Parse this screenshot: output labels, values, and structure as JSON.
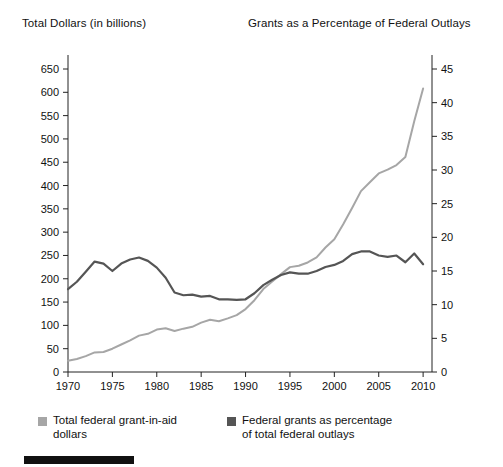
{
  "figure": {
    "left_axis_title": "Total Dollars (in billions)",
    "right_axis_title": "Grants as a Percentage of Federal Outlays"
  },
  "legend": {
    "entries": [
      {
        "label": "Total federal grant-in-aid dollars",
        "color": "#a6a6a6",
        "series": "total_dollars"
      },
      {
        "label": "Federal grants as percentage of total federal outlays",
        "color": "#555555",
        "series": "percent_outlays"
      }
    ]
  },
  "chart_data": {
    "type": "line",
    "title": "",
    "xlabel": "",
    "ylabel": "Total Dollars (in billions)",
    "y2label": "Grants as a Percentage of Federal Outlays",
    "xlim": [
      1970,
      2011
    ],
    "ylim": [
      0,
      650
    ],
    "y2lim": [
      0,
      45
    ],
    "grid": false,
    "legend_position": "bottom-left",
    "xticks": [
      1970,
      1975,
      1980,
      1985,
      1990,
      1995,
      2000,
      2005,
      2010
    ],
    "xtick_labels": [
      "1970",
      "1975",
      "1980",
      "1985",
      "1990",
      "1995",
      "2000",
      "2005",
      "2010"
    ],
    "yticks": [
      0,
      50,
      100,
      150,
      200,
      250,
      300,
      350,
      400,
      450,
      500,
      550,
      600,
      650
    ],
    "ytick_labels": [
      "0",
      "50",
      "100",
      "150",
      "200",
      "250",
      "300",
      "350",
      "400",
      "450",
      "500",
      "550",
      "600",
      "650"
    ],
    "y2ticks": [
      0,
      5,
      10,
      15,
      20,
      25,
      30,
      35,
      40,
      45
    ],
    "y2tick_labels": [
      "0",
      "5",
      "10",
      "15",
      "20",
      "25",
      "30",
      "35",
      "40",
      "45"
    ],
    "x": [
      1970,
      1971,
      1972,
      1973,
      1974,
      1975,
      1976,
      1977,
      1978,
      1979,
      1980,
      1981,
      1982,
      1983,
      1984,
      1985,
      1986,
      1987,
      1988,
      1989,
      1990,
      1991,
      1992,
      1993,
      1994,
      1995,
      1996,
      1997,
      1998,
      1999,
      2000,
      2001,
      2002,
      2003,
      2004,
      2005,
      2006,
      2007,
      2008,
      2009,
      2010
    ],
    "series": [
      {
        "name": "Total federal grant-in-aid dollars",
        "axis": "left",
        "color": "#a6a6a6",
        "units": "billions of dollars",
        "values": [
          24,
          28,
          34,
          42,
          43,
          50,
          59,
          68,
          78,
          82,
          91,
          94,
          88,
          93,
          97,
          106,
          112,
          109,
          115,
          122,
          135,
          154,
          178,
          194,
          210,
          225,
          228,
          235,
          246,
          267,
          285,
          317,
          352,
          388,
          407,
          426,
          434,
          444,
          461,
          538,
          608
        ]
      },
      {
        "name": "Federal grants as percentage of total federal outlays",
        "axis": "right",
        "color": "#555555",
        "units": "percent",
        "values": [
          12.3,
          13.4,
          14.9,
          16.4,
          16.1,
          15.0,
          16.1,
          16.7,
          17.0,
          16.5,
          15.5,
          14.0,
          11.8,
          11.4,
          11.5,
          11.2,
          11.3,
          10.8,
          10.8,
          10.7,
          10.8,
          11.7,
          12.9,
          13.7,
          14.4,
          14.8,
          14.6,
          14.6,
          15.0,
          15.6,
          15.9,
          16.5,
          17.5,
          17.9,
          17.9,
          17.3,
          17.1,
          17.3,
          16.3,
          17.6,
          16.0
        ]
      }
    ]
  }
}
